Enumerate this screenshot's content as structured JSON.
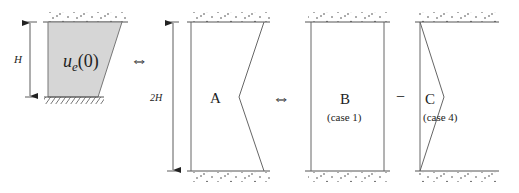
{
  "diagram": {
    "panel_left": {
      "dimension_label": "H",
      "symbol_base": "u",
      "symbol_sub": "e",
      "symbol_arg": "(0)"
    },
    "equivalence_1": "⇔",
    "panel_A": {
      "dimension_label": "2H",
      "label": "A"
    },
    "equivalence_2": "⇔",
    "panel_B": {
      "label": "B",
      "caption": "(case 1)"
    },
    "operator": "−",
    "panel_C": {
      "label": "C",
      "caption": "(case 4)"
    },
    "colors": {
      "line": "#555555",
      "fill": "#d8d8d8",
      "text": "#222222"
    }
  }
}
